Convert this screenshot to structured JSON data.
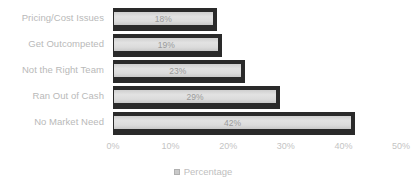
{
  "chart_data": {
    "type": "bar",
    "orientation": "horizontal",
    "title": "",
    "xlabel": "",
    "ylabel": "",
    "categories": [
      "Pricing/Cost Issues",
      "Get Outcompeted",
      "Not the Right Team",
      "Ran Out of Cash",
      "No Market Need"
    ],
    "values": [
      18,
      19,
      23,
      29,
      42
    ],
    "value_labels": [
      "18%",
      "19%",
      "23%",
      "29%",
      "42%"
    ],
    "xlim": [
      0,
      50
    ],
    "xticks": [
      0,
      10,
      20,
      30,
      40,
      50
    ],
    "xtick_labels": [
      "0%",
      "10%",
      "20%",
      "30%",
      "40%",
      "50%"
    ],
    "grid": false,
    "legend": {
      "position": "bottom",
      "entries": [
        {
          "label": "Percentage",
          "swatch_name": "legend-swatch-percentage",
          "color": "#c9c9c9"
        }
      ]
    },
    "series": [
      {
        "name": "Percentage",
        "values": [
          18,
          19,
          23,
          29,
          42
        ]
      }
    ],
    "colors": {
      "background": "#ffffff",
      "bar_fill": "#d8d8d8",
      "bar_outline": "#2a2a2a",
      "label_text": "#b9b9b9",
      "tick_text": "#c4c4c4",
      "value_text": "#9a9a9a"
    }
  }
}
